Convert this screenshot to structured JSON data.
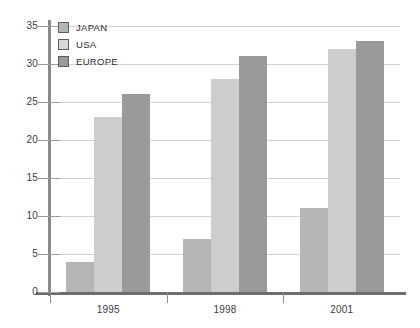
{
  "chart_data": {
    "type": "bar",
    "title": "",
    "xlabel": "",
    "ylabel": "",
    "categories": [
      "1995",
      "1998",
      "2001"
    ],
    "series": [
      {
        "name": "JAPAN",
        "values": [
          4,
          7,
          11
        ],
        "color": "#b5b5b5"
      },
      {
        "name": "USA",
        "values": [
          23,
          28,
          32
        ],
        "color": "#cdcdcd"
      },
      {
        "name": "EUROPE",
        "values": [
          26,
          31,
          33
        ],
        "color": "#9a9a9a"
      }
    ],
    "ylim": [
      0,
      35
    ],
    "ytick_step": 5,
    "yticks": [
      "0",
      "5",
      "10",
      "15",
      "20",
      "25",
      "30",
      "35"
    ],
    "grid": true,
    "legend_position": "top-left-inside"
  },
  "legend": {
    "items": [
      {
        "label": "JAPAN"
      },
      {
        "label": "USA"
      },
      {
        "label": "EUROPE"
      }
    ]
  },
  "axes": {
    "y_tick_labels": [
      "35",
      "30",
      "25",
      "20",
      "15",
      "10",
      "5",
      "0"
    ],
    "x_tick_labels": [
      "1995",
      "1998",
      "2001"
    ]
  }
}
